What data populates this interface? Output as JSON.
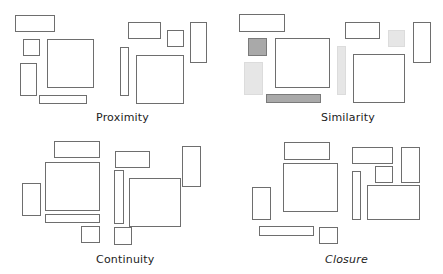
{
  "diagram": {
    "colors": {
      "outline": "#6e6e6e",
      "dark_fill": "#a9a9a9",
      "light_fill": "#e6e6e6"
    },
    "panels": [
      {
        "name": "proximity",
        "label": "Proximity"
      },
      {
        "name": "similarity",
        "label": "Similarity"
      },
      {
        "name": "continuity",
        "label": "Continuity"
      },
      {
        "name": "closure",
        "label": "Closure"
      }
    ]
  }
}
